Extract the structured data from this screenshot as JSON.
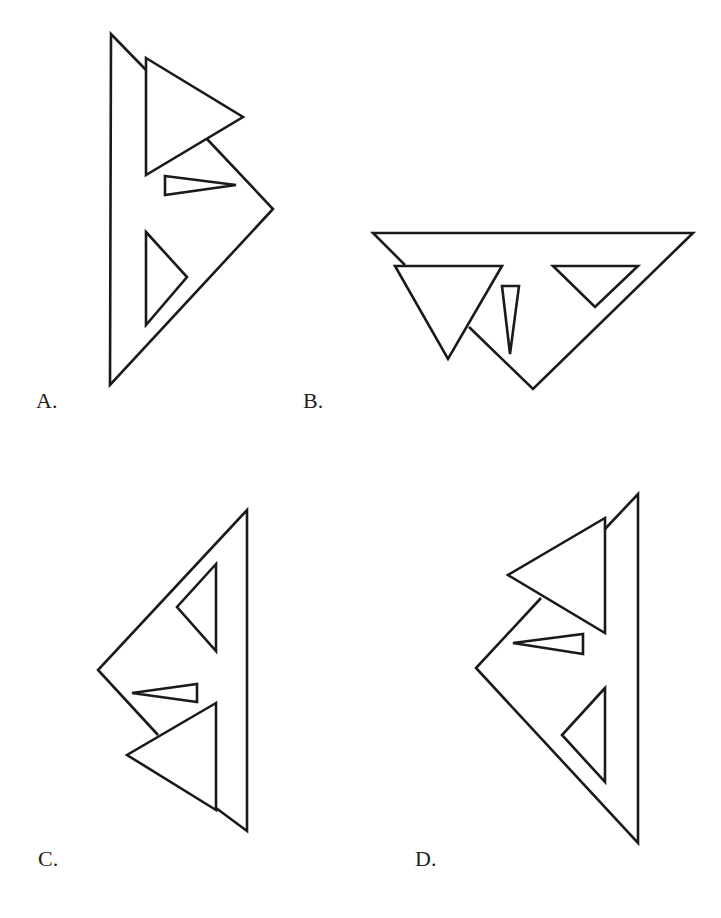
{
  "figure": {
    "stroke_color": "#1a1a1a",
    "background": "#ffffff"
  },
  "options": [
    {
      "label": "A.",
      "label_pos": [
        36,
        390
      ],
      "big_triangle_visible_edges": [
        [
          [
            146,
            70
          ],
          [
            111,
            34
          ],
          [
            110,
            385
          ],
          [
            273,
            209
          ],
          [
            207,
            139
          ]
        ]
      ],
      "triangles": [
        {
          "name": "top-triangle",
          "points": [
            [
              146,
              58
            ],
            [
              243,
              117
            ],
            [
              146,
              175
            ]
          ]
        },
        {
          "name": "thin-triangle",
          "points": [
            [
              165,
              176
            ],
            [
              236,
              185
            ],
            [
              165,
              195
            ]
          ]
        },
        {
          "name": "lower-triangle",
          "points": [
            [
              146,
              232
            ],
            [
              187,
              277
            ],
            [
              146,
              325
            ]
          ]
        }
      ]
    },
    {
      "label": "B.",
      "label_pos": [
        303,
        390
      ],
      "big_triangle_visible_edges": [
        [
          [
            405,
            265
          ],
          [
            373,
            233
          ],
          [
            693,
            233
          ],
          [
            533,
            389
          ],
          [
            469,
            327
          ]
        ]
      ],
      "triangles": [
        {
          "name": "left-triangle",
          "points": [
            [
              395,
              266
            ],
            [
              502,
              266
            ],
            [
              448,
              359
            ]
          ]
        },
        {
          "name": "thin-triangle",
          "points": [
            [
              502,
              286
            ],
            [
              519,
              286
            ],
            [
              510,
              354
            ]
          ]
        },
        {
          "name": "right-triangle",
          "points": [
            [
              553,
              266
            ],
            [
              638,
              266
            ],
            [
              595,
              307
            ]
          ]
        }
      ]
    },
    {
      "label": "C.",
      "label_pos": [
        38,
        848
      ],
      "big_triangle_visible_edges": [
        [
          [
            158,
            735
          ],
          [
            98,
            670
          ],
          [
            247,
            510
          ],
          [
            247,
            831
          ],
          [
            216,
            808
          ]
        ]
      ],
      "triangles": [
        {
          "name": "upper-triangle",
          "points": [
            [
              216,
              564
            ],
            [
              177,
              607
            ],
            [
              216,
              651
            ]
          ]
        },
        {
          "name": "thin-triangle",
          "points": [
            [
              132,
              693
            ],
            [
              197,
              684
            ],
            [
              197,
              702
            ]
          ]
        },
        {
          "name": "lower-triangle",
          "points": [
            [
              216,
              703
            ],
            [
              127,
              755
            ],
            [
              216,
              810
            ]
          ]
        }
      ]
    },
    {
      "label": "D.",
      "label_pos": [
        415,
        848
      ],
      "big_triangle_visible_edges": [
        [
          [
            541,
            598
          ],
          [
            476,
            668
          ],
          [
            638,
            843
          ],
          [
            638,
            494
          ],
          [
            605,
            529
          ]
        ]
      ],
      "triangles": [
        {
          "name": "upper-triangle",
          "points": [
            [
              605,
              518
            ],
            [
              508,
              575
            ],
            [
              605,
              633
            ]
          ]
        },
        {
          "name": "thin-triangle",
          "points": [
            [
              513,
              643
            ],
            [
              583,
              634
            ],
            [
              583,
              654
            ]
          ]
        },
        {
          "name": "lower-triangle",
          "points": [
            [
              605,
              688
            ],
            [
              562,
              735
            ],
            [
              605,
              782
            ]
          ]
        }
      ]
    }
  ]
}
